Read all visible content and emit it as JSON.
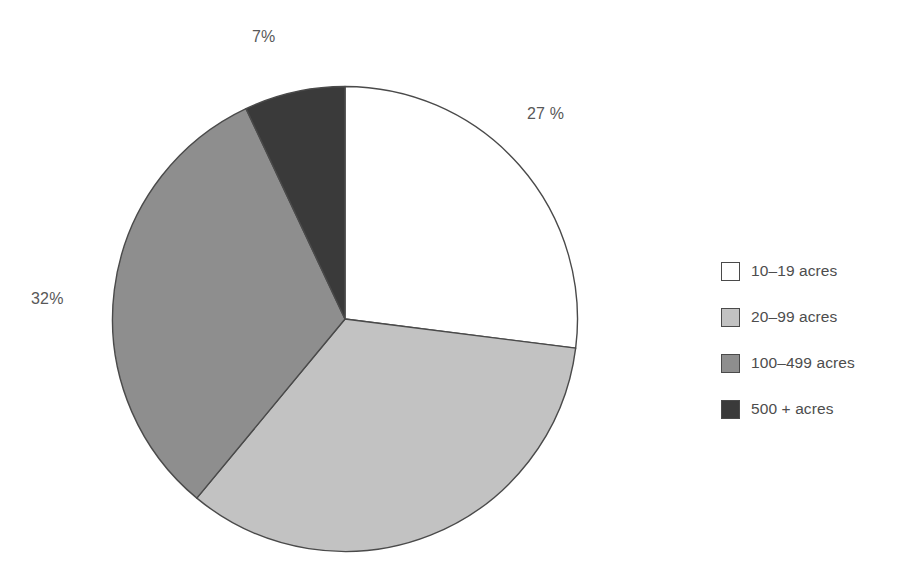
{
  "chart_data": {
    "type": "pie",
    "title": "",
    "subtitle": "",
    "xlabel": "",
    "ylabel": "",
    "legend_position": "right",
    "grid": false,
    "start_angle_deg": 0,
    "direction": "clockwise",
    "categories": [
      "10–19 acres",
      "20–99 acres",
      "100–499 acres",
      "500 + acres"
    ],
    "values": [
      27,
      34,
      32,
      7
    ],
    "value_labels": [
      "27 %",
      "",
      "32%",
      "7%"
    ],
    "colors": [
      "#ffffff",
      "#c2c2c2",
      "#8e8e8e",
      "#3a3a3a"
    ],
    "slice_border_color": "#4a4a4a",
    "slices": [
      {
        "label": "10–19 acres",
        "value": 27,
        "display": "27 %",
        "color": "#ffffff"
      },
      {
        "label": "20–99 acres",
        "value": 34,
        "display": "",
        "color": "#c2c2c2"
      },
      {
        "label": "100–499 acres",
        "value": 32,
        "display": "32%",
        "color": "#8e8e8e"
      },
      {
        "label": "500 + acres",
        "value": 7,
        "display": "7%",
        "color": "#3a3a3a"
      }
    ]
  },
  "labels": {
    "top": "7%",
    "right": "27 %",
    "left": "32%"
  },
  "legend": {
    "items": [
      {
        "label": "10–19 acres",
        "color": "#ffffff"
      },
      {
        "label": "20–99 acres",
        "color": "#c2c2c2"
      },
      {
        "label": "100–499 acres",
        "color": "#8e8e8e"
      },
      {
        "label": "500 + acres",
        "color": "#3a3a3a"
      }
    ]
  }
}
